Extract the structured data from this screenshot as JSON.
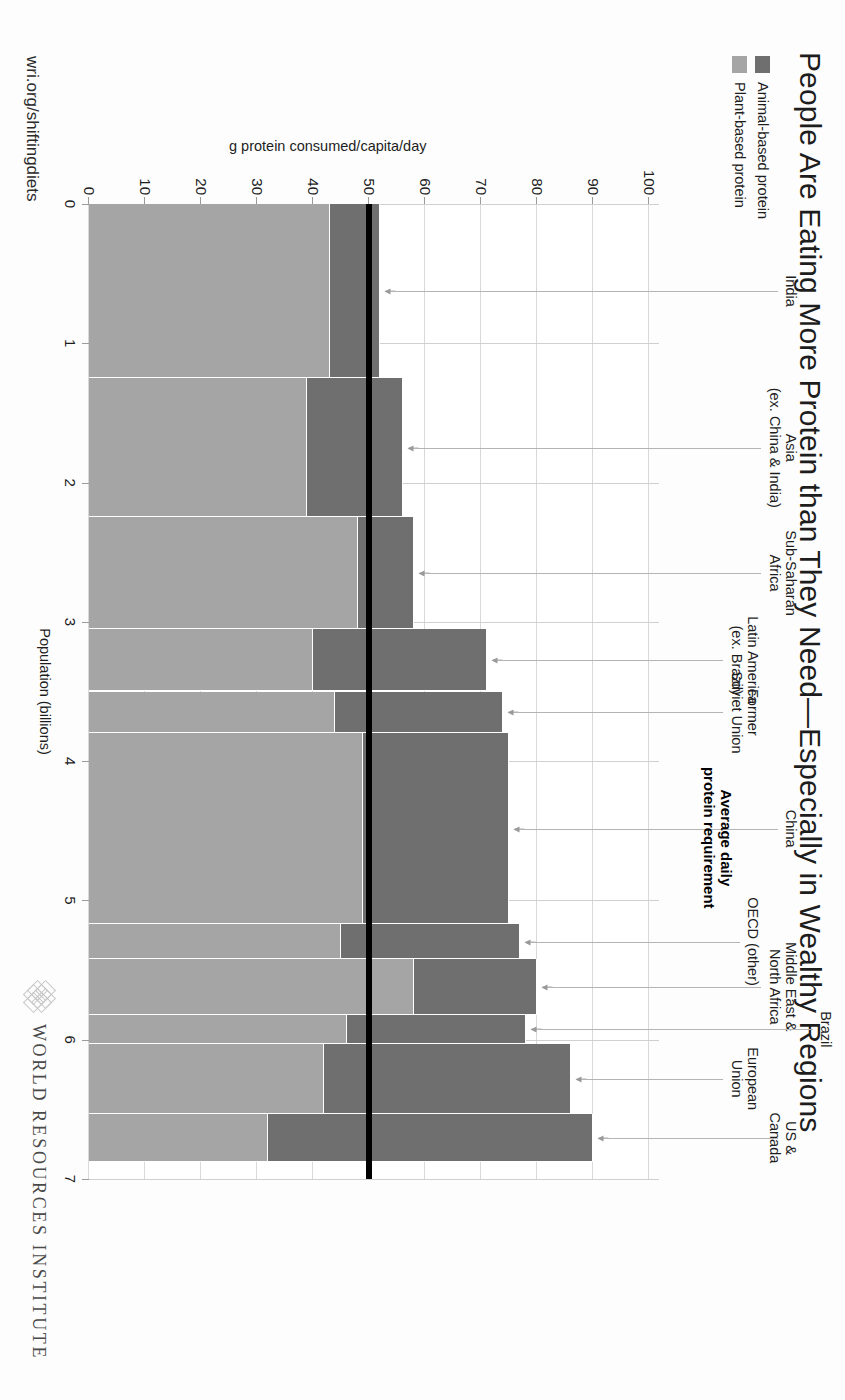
{
  "title": "People Are Eating More Protein than They Need—Especially in Wealthy Regions",
  "footer": {
    "url": "wri.org/shiftingdiets",
    "brand": "WORLD RESOURCES INSTITUTE",
    "brand_mark_icon": "wri-diamond-lattice-icon"
  },
  "legend": {
    "position": "top-left",
    "items": [
      {
        "label": "Animal-based protein",
        "color": "#6f6f6f"
      },
      {
        "label": "Plant-based protein",
        "color": "#a5a5a5"
      }
    ]
  },
  "annotation": {
    "text": "Average daily\nprotein requirement",
    "value": 50,
    "color": "#000000"
  },
  "chart_data": {
    "type": "bar",
    "variant": "marimekko-stacked-100-width",
    "title": "People Are Eating More Protein than They Need—Especially in Wealthy Regions",
    "xlabel": "Population (billions)",
    "ylabel": "g protein consumed/capita/day",
    "xlim": [
      0,
      7
    ],
    "ylim": [
      0,
      100
    ],
    "xticks": [
      0,
      1,
      2,
      3,
      4,
      5,
      6,
      7
    ],
    "yticks": [
      0,
      10,
      20,
      30,
      40,
      50,
      60,
      70,
      80,
      90,
      100
    ],
    "grid": true,
    "legend_position": "top-left",
    "series": [
      {
        "name": "Plant-based protein",
        "color": "#a5a5a5"
      },
      {
        "name": "Animal-based protein",
        "color": "#6f6f6f"
      }
    ],
    "annotations": [
      {
        "label": "Average daily protein requirement",
        "y": 50,
        "type": "hline",
        "color": "#000000"
      }
    ],
    "categories": [
      {
        "label": "India",
        "pop_start": 0.0,
        "pop_end": 1.25,
        "plant": 43,
        "animal": 9,
        "total": 52
      },
      {
        "label": "Asia\n(ex. China & India)",
        "pop_start": 1.25,
        "pop_end": 2.25,
        "plant": 39,
        "animal": 17,
        "total": 56
      },
      {
        "label": "Sub-Saharan\nAfrica",
        "pop_start": 2.25,
        "pop_end": 3.05,
        "plant": 48,
        "animal": 10,
        "total": 58
      },
      {
        "label": "Latin America\n(ex. Brazil)",
        "pop_start": 3.05,
        "pop_end": 3.5,
        "plant": 40,
        "animal": 31,
        "total": 71
      },
      {
        "label": "Former\nSoviet Union",
        "pop_start": 3.5,
        "pop_end": 3.8,
        "plant": 44,
        "animal": 30,
        "total": 74
      },
      {
        "label": "China",
        "pop_start": 3.8,
        "pop_end": 5.17,
        "plant": 49,
        "animal": 26,
        "total": 75
      },
      {
        "label": "OECD (other)",
        "pop_start": 5.17,
        "pop_end": 5.42,
        "plant": 45,
        "animal": 32,
        "total": 77
      },
      {
        "label": "Middle East &\nNorth Africa",
        "pop_start": 5.42,
        "pop_end": 5.82,
        "plant": 58,
        "animal": 22,
        "total": 80
      },
      {
        "label": "Brazil",
        "pop_start": 5.82,
        "pop_end": 6.03,
        "plant": 46,
        "animal": 32,
        "total": 78
      },
      {
        "label": "European\nUnion",
        "pop_start": 6.03,
        "pop_end": 6.53,
        "plant": 42,
        "animal": 44,
        "total": 86
      },
      {
        "label": "US & Canada",
        "pop_start": 6.53,
        "pop_end": 6.88,
        "plant": 32,
        "animal": 58,
        "total": 90
      }
    ]
  }
}
